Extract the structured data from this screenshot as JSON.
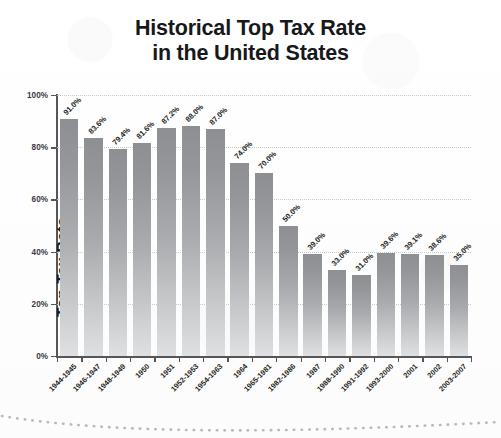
{
  "chart_data": {
    "type": "bar",
    "title": "Historical Top Tax Rate in the United States",
    "title_line1": "Historical Top Tax Rate",
    "title_line2": "in the United States",
    "xlabel": "",
    "ylabel": "Top Tax Rate",
    "ylim": [
      0,
      100
    ],
    "y_ticks": [
      "0%",
      "20%",
      "40%",
      "60%",
      "80%",
      "100%"
    ],
    "y_tick_values": [
      0,
      20,
      40,
      60,
      80,
      100
    ],
    "grid": "horizontal-dotted",
    "legend": "none",
    "bar_color_top": "#8d8f92",
    "bar_color_bottom": "#dfe0e2",
    "categories": [
      "1944-1945",
      "1946-1947",
      "1948-1949",
      "1950",
      "1951",
      "1952-1953",
      "1954-1963",
      "1964",
      "1965-1981",
      "1982-1986",
      "1987",
      "1988-1990",
      "1991-1992",
      "1993-2000",
      "2001",
      "2002",
      "2003-2007"
    ],
    "values": [
      91.0,
      83.6,
      79.4,
      81.6,
      87.2,
      88.0,
      87.0,
      74.0,
      70.0,
      50.0,
      39.0,
      33.0,
      31.0,
      39.6,
      39.1,
      38.6,
      35.0
    ],
    "data_labels": [
      "91.0%",
      "83.6%",
      "79.4%",
      "81.6%",
      "87.2%",
      "88.0%",
      "87.0%",
      "74.0%",
      "70.0%",
      "50.0%",
      "39.0%",
      "33.0%",
      "31.0%",
      "39.6%",
      "39.1%",
      "38.6%",
      "35.0%"
    ]
  }
}
